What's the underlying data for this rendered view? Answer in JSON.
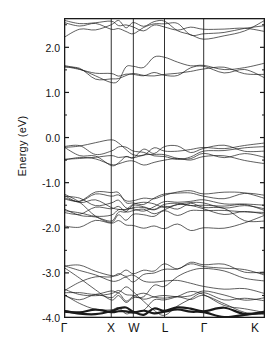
{
  "figure": {
    "kind": "electronic-band-structure",
    "annotation_label": "C",
    "annotation_sub": "60"
  },
  "chart_data": {
    "type": "line",
    "title": "",
    "subtitle": "",
    "xlabel": "",
    "ylabel": "Energy (eV)",
    "annotations": [
      {
        "text": "C60",
        "x_frac": 0.72,
        "y_ev": 0.75
      }
    ],
    "grid": false,
    "legend": "none",
    "ylim": [
      -4.0,
      2.65
    ],
    "ytick_values": [
      2.0,
      1.0,
      0.0,
      -1.0,
      -2.0,
      -3.0,
      -4.0
    ],
    "ytick_labels": [
      "2.0",
      "1.0",
      "0.0",
      "-1.0",
      "-2.0",
      "-3.0",
      "-4.0"
    ],
    "xtick_labels": [
      "Γ",
      "X",
      "W",
      "L",
      "Γ",
      "K"
    ],
    "xtick_fracs": [
      0.0,
      0.235,
      0.345,
      0.5,
      0.695,
      1.0
    ],
    "high_symmetry_vertical_lines": [
      0.235,
      0.345,
      0.5,
      0.695
    ],
    "line_color": "#1a1a1a",
    "line_width": 0.7,
    "x": [
      0.0,
      0.235,
      0.345,
      0.5,
      0.695,
      1.0
    ],
    "series": [
      {
        "name": "band-01",
        "values": [
          -3.86,
          -3.87,
          -3.88,
          -3.86,
          -3.87,
          -3.88
        ]
      },
      {
        "name": "band-02",
        "values": [
          -3.84,
          -3.85,
          -3.86,
          -3.84,
          -3.85,
          -3.86
        ]
      },
      {
        "name": "band-03",
        "values": [
          -3.5,
          -3.55,
          -3.52,
          -3.56,
          -3.5,
          -3.92
        ]
      },
      {
        "name": "band-04",
        "values": [
          -3.48,
          -3.82,
          -3.86,
          -3.6,
          -3.48,
          -3.88
        ]
      },
      {
        "name": "band-05",
        "values": [
          -3.44,
          -3.4,
          -3.42,
          -3.94,
          -3.44,
          -3.62
        ]
      },
      {
        "name": "band-06",
        "values": [
          -3.4,
          -3.09,
          -3.05,
          -3.18,
          -3.3,
          -3.46
        ]
      },
      {
        "name": "band-07",
        "values": [
          -3.36,
          -3.46,
          -3.5,
          -3.5,
          -3.4,
          -3.55
        ]
      },
      {
        "name": "band-08",
        "values": [
          -2.85,
          -3.06,
          -3.02,
          -2.8,
          -2.82,
          -2.98
        ]
      },
      {
        "name": "band-09",
        "values": [
          -2.84,
          -3.18,
          -3.2,
          -2.92,
          -2.86,
          -3.05
        ]
      },
      {
        "name": "band-10",
        "values": [
          -2.88,
          -3.6,
          -3.55,
          -3.3,
          -2.9,
          -3.18
        ]
      },
      {
        "name": "band-11",
        "values": [
          -1.96,
          -1.9,
          -1.95,
          -2.02,
          -2.0,
          -1.72
        ]
      },
      {
        "name": "band-12",
        "values": [
          -1.66,
          -1.58,
          -1.62,
          -1.6,
          -1.58,
          -1.7
        ]
      },
      {
        "name": "band-13",
        "values": [
          -1.62,
          -1.72,
          -1.55,
          -1.52,
          -1.55,
          -1.85
        ]
      },
      {
        "name": "band-14",
        "values": [
          -1.58,
          -1.85,
          -1.5,
          -1.48,
          -1.5,
          -1.62
        ]
      },
      {
        "name": "band-15",
        "values": [
          -1.36,
          -1.22,
          -1.45,
          -1.25,
          -1.3,
          -1.28
        ]
      },
      {
        "name": "band-16",
        "values": [
          -1.33,
          -1.3,
          -1.4,
          -1.28,
          -1.25,
          -1.35
        ]
      },
      {
        "name": "band-17",
        "values": [
          -1.3,
          -1.45,
          -1.58,
          -1.42,
          -1.38,
          -1.5
        ]
      },
      {
        "name": "band-18",
        "values": [
          -1.28,
          -1.55,
          -1.48,
          -1.55,
          -1.45,
          -1.58
        ]
      },
      {
        "name": "band-19",
        "values": [
          -1.25,
          -1.88,
          -1.7,
          -1.62,
          -1.62,
          -1.66
        ]
      },
      {
        "name": "band-20",
        "values": [
          -0.5,
          -0.6,
          -0.52,
          -0.5,
          -0.42,
          -0.58
        ]
      },
      {
        "name": "band-21",
        "values": [
          -0.48,
          -0.4,
          -0.45,
          -0.38,
          -0.35,
          -0.44
        ]
      },
      {
        "name": "band-22",
        "values": [
          -0.22,
          -0.05,
          -0.38,
          -0.3,
          -0.22,
          -0.12
        ]
      },
      {
        "name": "band-23",
        "values": [
          -0.21,
          -0.62,
          -0.45,
          -0.2,
          -0.24,
          -0.3
        ]
      },
      {
        "name": "band-24",
        "values": [
          -0.2,
          -0.3,
          -0.3,
          -0.42,
          -0.3,
          -0.2
        ]
      },
      {
        "name": "band-25",
        "values": [
          1.6,
          1.22,
          1.58,
          1.78,
          1.6,
          1.65
        ]
      },
      {
        "name": "band-26",
        "values": [
          1.58,
          1.42,
          1.4,
          1.38,
          1.58,
          1.32
        ]
      },
      {
        "name": "band-27",
        "values": [
          1.56,
          1.3,
          1.42,
          1.4,
          1.52,
          1.4
        ]
      },
      {
        "name": "band-28",
        "values": [
          2.22,
          2.5,
          2.55,
          2.58,
          2.18,
          2.6
        ]
      },
      {
        "name": "band-29",
        "values": [
          2.55,
          2.4,
          2.3,
          2.52,
          2.3,
          2.48
        ]
      },
      {
        "name": "band-30",
        "values": [
          2.6,
          2.58,
          2.45,
          2.45,
          2.4,
          2.35
        ]
      }
    ]
  }
}
